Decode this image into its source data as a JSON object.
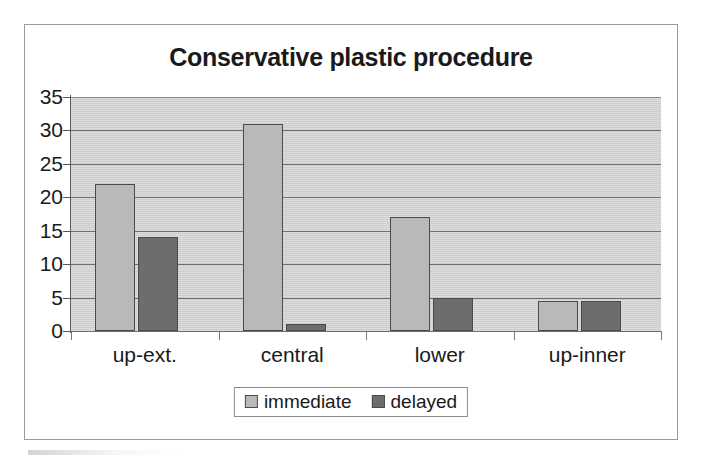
{
  "chart_data": {
    "type": "bar",
    "title": "Conservative plastic procedure",
    "xlabel": "",
    "ylabel": "",
    "categories": [
      "up-ext.",
      "central",
      "lower",
      "up-inner"
    ],
    "series": [
      {
        "name": "immediate",
        "color": "#b9b9b9",
        "values": [
          22,
          31,
          17,
          4.5
        ]
      },
      {
        "name": "delayed",
        "color": "#6d6d6d",
        "values": [
          14,
          1,
          5,
          4.5
        ]
      }
    ],
    "ylim": [
      0,
      35
    ],
    "ytick_step": 5,
    "yticks": [
      "35",
      "30",
      "25",
      "20",
      "15",
      "10",
      "5",
      "0"
    ],
    "grid": true,
    "legend_position": "bottom",
    "plot_background": "#d5d5d5",
    "frame_border": "#9a9a9a"
  },
  "legend": {
    "entries": [
      {
        "label": "immediate"
      },
      {
        "label": "delayed"
      }
    ]
  }
}
